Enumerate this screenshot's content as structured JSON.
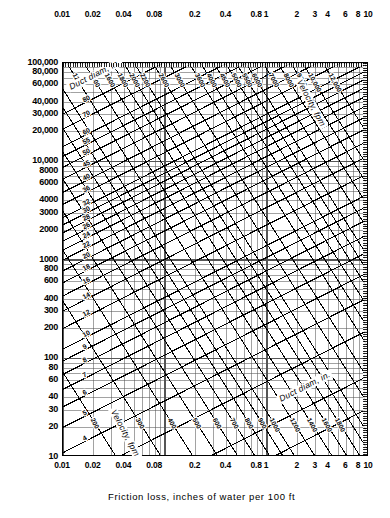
{
  "chart_data": {
    "type": "line",
    "title": "",
    "xlabel": "Friction loss, inches of water per 100 ft",
    "ylabel": "Cu ft of air per minute",
    "xscale": "log",
    "yscale": "log",
    "xlim": [
      0.01,
      10
    ],
    "ylim": [
      10,
      100000
    ],
    "grid": true,
    "legend": "none",
    "x_ticks_bottom": [
      "0.01",
      "0.02",
      "0.04",
      "0.08",
      "0.2",
      "0.4",
      "0.8",
      "1",
      "2",
      "3",
      "4",
      "6",
      "8",
      "10"
    ],
    "x_tick_values": [
      0.01,
      0.02,
      0.04,
      0.08,
      0.2,
      0.4,
      0.8,
      1,
      2,
      3,
      4,
      6,
      8,
      10
    ],
    "x_ticks_top": [
      "0.01",
      "0.02",
      "0.04",
      "0.08",
      "0.2",
      "0.4",
      "0.8",
      "1",
      "2",
      "3",
      "4",
      "6",
      "8",
      "10"
    ],
    "y_ticks": [
      "100,000",
      "80,000",
      "60,000",
      "40,000",
      "30,000",
      "20,000",
      "10,000",
      "8000",
      "6000",
      "4000",
      "3000",
      "2000",
      "1000",
      "800",
      "600",
      "400",
      "300",
      "200",
      "100",
      "80",
      "60",
      "40",
      "30",
      "20",
      "10"
    ],
    "y_tick_values": [
      100000,
      80000,
      60000,
      40000,
      30000,
      20000,
      10000,
      8000,
      6000,
      4000,
      3000,
      2000,
      1000,
      800,
      600,
      400,
      300,
      200,
      100,
      80,
      60,
      40,
      30,
      20,
      10
    ],
    "series": [
      {
        "name": "Duct diameter (in.)",
        "family": "duct-diameter",
        "units": "in.",
        "direction": "up-right",
        "values": [
          1.5,
          2,
          3,
          4,
          5,
          6,
          7,
          8,
          9,
          10,
          12,
          14,
          16,
          18,
          20,
          22,
          24,
          26,
          28,
          30,
          32,
          36,
          40,
          45,
          50,
          55,
          60,
          70,
          80
        ],
        "labels_left": [
          "80",
          "70",
          "60",
          "55",
          "50",
          "45",
          "40",
          "36",
          "32",
          "30",
          "28",
          "26",
          "24",
          "22",
          "20",
          "18",
          "16",
          "14",
          "12",
          "10",
          "9",
          "8",
          "7",
          "6",
          "5",
          "4"
        ],
        "labels_right": [
          "26",
          "24",
          "22",
          "20",
          "18",
          "16",
          "14",
          "12",
          "10",
          "9",
          "8",
          "7",
          "6",
          "5",
          "4",
          "3",
          "2",
          "1½"
        ]
      },
      {
        "name": "Velocity (fpm)",
        "family": "velocity",
        "units": "fpm",
        "direction": "down-right",
        "values": [
          200,
          300,
          400,
          500,
          600,
          700,
          800,
          900,
          1000,
          1200,
          1400,
          1600,
          1800,
          2000,
          2200,
          2600,
          3000,
          3600,
          4000,
          4500,
          5000,
          5500,
          6000,
          7000,
          8000,
          9000,
          10000,
          12000
        ],
        "labels_bottom": [
          "200",
          "300",
          "400",
          "500",
          "600",
          "700",
          "800",
          "900",
          "1000",
          "1200",
          "1400",
          "1600",
          "1800"
        ],
        "labels_top": [
          "1200",
          "1400",
          "1600",
          "1800",
          "2000",
          "2200",
          "2600",
          "3000",
          "3600",
          "4000",
          "4500",
          "5000",
          "5500",
          "6000",
          "7000",
          "8000",
          "9000",
          "10,000",
          "12,000"
        ]
      }
    ],
    "annotations": [
      {
        "text": "Duct diam, in.",
        "position": "upper-left",
        "rotation": -27
      },
      {
        "text": "Velocity, fpm",
        "position": "upper-right",
        "rotation": 62
      },
      {
        "text": "Velocity, fpm",
        "position": "lower-left",
        "rotation": 62
      },
      {
        "text": "Duct diam, in.",
        "position": "lower-right",
        "rotation": -27
      }
    ]
  },
  "axes": {
    "x_title": "Friction loss, inches of water per 100 ft",
    "y_title": "Cu ft of air per minute"
  },
  "annotations": {
    "duct_upper": "Duct diam, in.",
    "velocity_upper": "Velocity, fpm",
    "velocity_lower": "Velocity, fpm",
    "duct_lower": "Duct diam, in."
  },
  "colors": {
    "ink": "#000000",
    "paper": "#ffffff",
    "grid": "#4a4a4a"
  }
}
